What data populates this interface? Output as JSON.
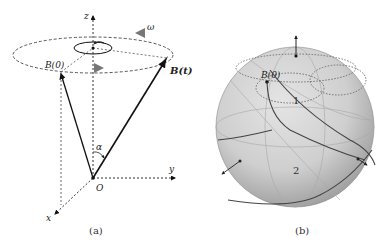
{
  "panel_a": {
    "caption": "(a)",
    "labels": {
      "z_axis": "z",
      "y_axis": "y",
      "x_axis": "x",
      "origin": "O",
      "omega": "ω",
      "alpha": "α",
      "b0": "B(0)",
      "bt": "B(t)"
    }
  },
  "panel_b": {
    "caption": "(b)",
    "labels": {
      "b0": "B(0)",
      "region1": "1",
      "region2": "2"
    }
  }
}
